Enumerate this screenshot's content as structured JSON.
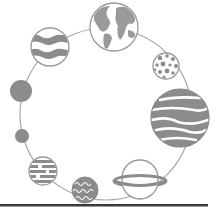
{
  "illustration": {
    "subject": "planets arranged around a circular orbit",
    "colors": {
      "background": "#ffffff",
      "planet_fill": "#8c8c8c",
      "planet_dark": "#7a7a7a",
      "outline": "#9a9a9a",
      "orbit": "#a8a8a8",
      "baseline": "#3a3a3a"
    },
    "planets": [
      {
        "name": "earth",
        "cx": 114,
        "cy": 27,
        "r": 24
      },
      {
        "name": "wavy-striped-planet",
        "cx": 50,
        "cy": 47,
        "r": 19
      },
      {
        "name": "spotted-planet",
        "cx": 166,
        "cy": 66,
        "r": 13
      },
      {
        "name": "large-striped-planet",
        "cx": 180,
        "cy": 118,
        "r": 29
      },
      {
        "name": "ringed-planet",
        "cx": 140,
        "cy": 178,
        "r": 18
      },
      {
        "name": "squiggle-planet",
        "cx": 85,
        "cy": 190,
        "r": 13
      },
      {
        "name": "dashed-planet",
        "cx": 43,
        "cy": 171,
        "r": 14
      },
      {
        "name": "small-solid-planet",
        "cx": 22,
        "cy": 136,
        "r": 7
      },
      {
        "name": "medium-solid-planet",
        "cx": 21,
        "cy": 91,
        "r": 11
      }
    ]
  }
}
